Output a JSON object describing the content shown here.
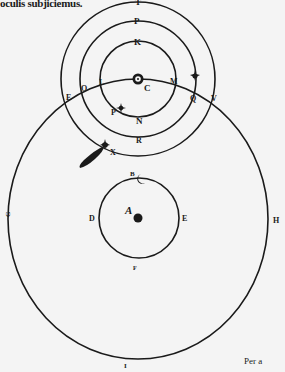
{
  "page": {
    "caption_text": "oculis subjiciemus.",
    "catchword": "Per a"
  },
  "figure": {
    "colors": {
      "ink": "#1a1a1a",
      "paper": "#f4f4f4"
    },
    "labels": {
      "T": "T",
      "P": "P",
      "K": "K",
      "C": "C",
      "L": "L",
      "M": "M",
      "O": "O",
      "E_left": "E",
      "Q": "Q",
      "V": "V",
      "N": "N",
      "R": "R",
      "X": "X",
      "star_left": "P",
      "B": "B",
      "D": "D",
      "E": "E",
      "F": "F",
      "A": "A",
      "G": "G",
      "H": "H",
      "I": "I"
    }
  }
}
